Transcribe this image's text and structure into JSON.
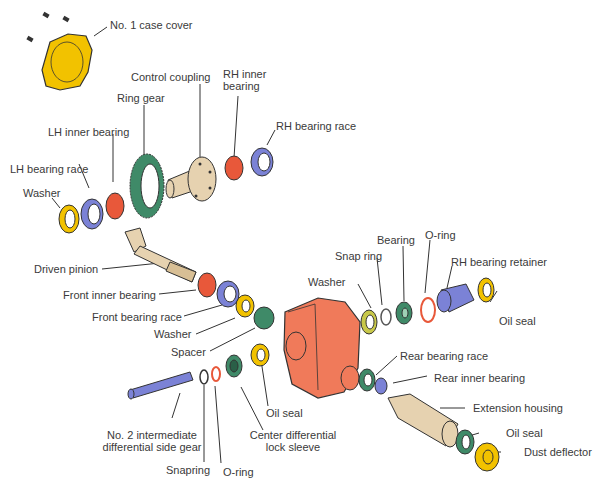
{
  "diagram": {
    "type": "exploded-view parts diagram",
    "colors": {
      "yellow": "#f2c200",
      "blue": "#7b82d6",
      "red_bearing": "#e8583a",
      "green": "#3f8a68",
      "case_orange": "#f07a5a",
      "tan": "#e6d2b0",
      "line": "#333333"
    },
    "labels": [
      {
        "id": "no1-case-cover",
        "text": "No. 1 case cover"
      },
      {
        "id": "control-coupling",
        "text": "Control coupling"
      },
      {
        "id": "rh-inner-bearing-1",
        "text": "RH inner"
      },
      {
        "id": "rh-inner-bearing-2",
        "text": "bearing"
      },
      {
        "id": "ring-gear",
        "text": "Ring gear"
      },
      {
        "id": "rh-bearing-race",
        "text": "RH bearing race"
      },
      {
        "id": "lh-inner-bearing",
        "text": "LH inner bearing"
      },
      {
        "id": "lh-bearing-race",
        "text": "LH bearing race"
      },
      {
        "id": "washer-left",
        "text": "Washer"
      },
      {
        "id": "driven-pinion",
        "text": "Driven pinion"
      },
      {
        "id": "front-inner-bearing",
        "text": "Front inner bearing"
      },
      {
        "id": "front-bearing-race",
        "text": "Front bearing race"
      },
      {
        "id": "washer-mid",
        "text": "Washer"
      },
      {
        "id": "spacer",
        "text": "Spacer"
      },
      {
        "id": "washer-right",
        "text": "Washer"
      },
      {
        "id": "snap-ring",
        "text": "Snap ring"
      },
      {
        "id": "bearing",
        "text": "Bearing"
      },
      {
        "id": "o-ring-right",
        "text": "O-ring"
      },
      {
        "id": "rh-bearing-retainer",
        "text": "RH bearing retainer"
      },
      {
        "id": "oil-seal-right",
        "text": "Oil seal"
      },
      {
        "id": "rear-bearing-race",
        "text": "Rear bearing race"
      },
      {
        "id": "rear-inner-bearing",
        "text": "Rear inner bearing"
      },
      {
        "id": "extension-housing",
        "text": "Extension housing"
      },
      {
        "id": "oil-seal-rear",
        "text": "Oil seal"
      },
      {
        "id": "dust-deflector",
        "text": "Dust deflector"
      },
      {
        "id": "oil-seal-center",
        "text": "Oil seal"
      },
      {
        "id": "center-diff-lock-sleeve-1",
        "text": "Center differential"
      },
      {
        "id": "center-diff-lock-sleeve-2",
        "text": "lock sleeve"
      },
      {
        "id": "no2-intermediate-1",
        "text": "No. 2 intermediate"
      },
      {
        "id": "no2-intermediate-2",
        "text": "differential side gear"
      },
      {
        "id": "snapring-bottom",
        "text": "Snapring"
      },
      {
        "id": "o-ring-bottom",
        "text": "O-ring"
      }
    ]
  }
}
